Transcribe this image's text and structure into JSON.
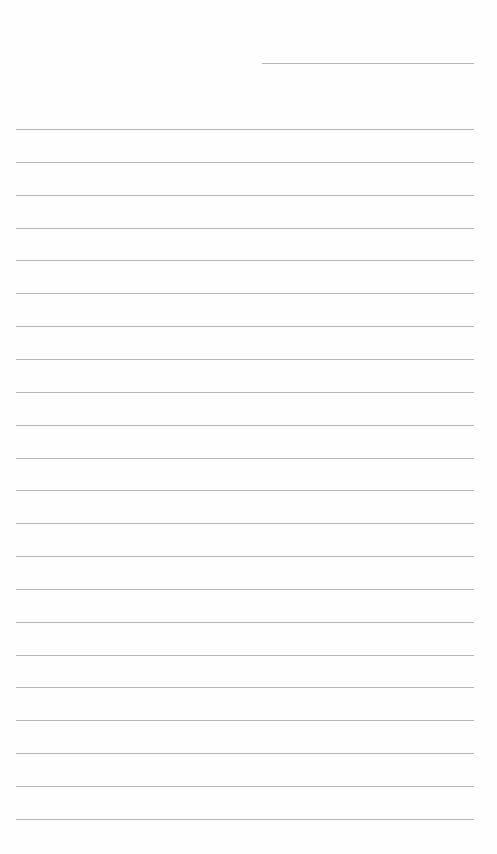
{
  "page": {
    "type": "blank lined sheet",
    "header_line": {
      "top": 63,
      "left": 262,
      "width": 212
    },
    "ruled_lines": {
      "count": 22,
      "first_top": 129,
      "spacing": 32.85,
      "left": 16,
      "width": 458
    },
    "line_color": "#b4b4b4",
    "background": "#fefefe"
  }
}
